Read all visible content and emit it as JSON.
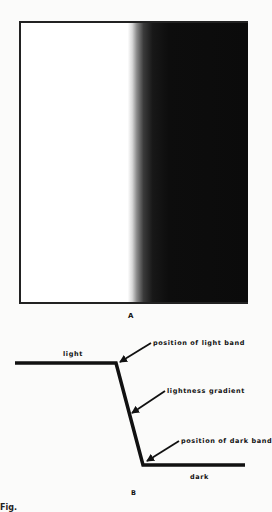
{
  "panel_a": {
    "label": "A",
    "description": "light-to-dark edge with lightness gradient",
    "light_color": "#ffffff",
    "dark_color": "#0b0b0b"
  },
  "panel_b": {
    "label": "B",
    "line_labels": {
      "light": "light",
      "dark": "dark"
    },
    "annotations": [
      {
        "id": "light-band",
        "text": "position of light band"
      },
      {
        "id": "gradient",
        "text": "lightness gradient"
      },
      {
        "id": "dark-band",
        "text": "position of dark band"
      }
    ]
  },
  "caption": {
    "text": "Fig."
  }
}
